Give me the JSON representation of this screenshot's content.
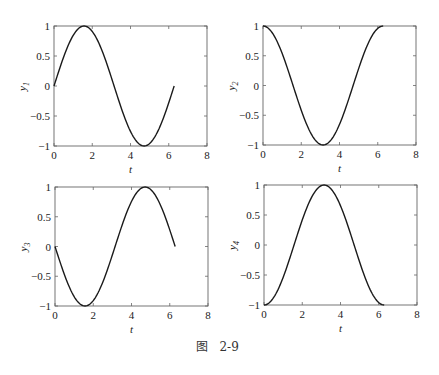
{
  "caption": "图   2-9",
  "chart_data": [
    {
      "type": "line",
      "title": "",
      "xlabel": "t",
      "ylabel": "y1",
      "xlim": [
        0,
        8
      ],
      "ylim": [
        -1,
        1
      ],
      "xticks": [
        0,
        2,
        4,
        6,
        8
      ],
      "yticks": [
        -1,
        -0.5,
        0,
        0.5,
        1
      ],
      "function": "sin(t)",
      "x": [
        0,
        0.5,
        1,
        1.5708,
        2,
        2.5,
        3,
        3.1416,
        3.5,
        4,
        4.5,
        4.7124,
        5,
        5.5,
        6,
        6.2832
      ],
      "values": [
        0,
        0.479,
        0.841,
        1,
        0.909,
        0.598,
        0.141,
        0,
        -0.351,
        -0.757,
        -0.978,
        -1,
        -0.959,
        -0.706,
        -0.279,
        0
      ]
    },
    {
      "type": "line",
      "title": "",
      "xlabel": "t",
      "ylabel": "y2",
      "xlim": [
        0,
        8
      ],
      "ylim": [
        -1,
        1
      ],
      "xticks": [
        0,
        2,
        4,
        6,
        8
      ],
      "yticks": [
        -1,
        -0.5,
        0,
        0.5,
        1
      ],
      "function": "cos(t)",
      "x": [
        0,
        0.5,
        1,
        1.5708,
        2,
        2.5,
        3,
        3.1416,
        3.5,
        4,
        4.5,
        4.7124,
        5,
        5.5,
        6,
        6.2832
      ],
      "values": [
        1,
        0.878,
        0.54,
        0,
        -0.416,
        -0.801,
        -0.99,
        -1,
        -0.936,
        -0.654,
        -0.211,
        0,
        0.284,
        0.709,
        0.96,
        1
      ]
    },
    {
      "type": "line",
      "title": "",
      "xlabel": "t",
      "ylabel": "y3",
      "xlim": [
        0,
        8
      ],
      "ylim": [
        -1,
        1
      ],
      "xticks": [
        0,
        2,
        4,
        6,
        8
      ],
      "yticks": [
        -1,
        -0.5,
        0,
        0.5,
        1
      ],
      "function": "-sin(t)",
      "x": [
        0,
        0.5,
        1,
        1.5708,
        2,
        2.5,
        3,
        3.1416,
        3.5,
        4,
        4.5,
        4.7124,
        5,
        5.5,
        6,
        6.2832
      ],
      "values": [
        0,
        -0.479,
        -0.841,
        -1,
        -0.909,
        -0.598,
        -0.141,
        0,
        0.351,
        0.757,
        0.978,
        1,
        0.959,
        0.706,
        0.279,
        0
      ]
    },
    {
      "type": "line",
      "title": "",
      "xlabel": "t",
      "ylabel": "y4",
      "xlim": [
        0,
        8
      ],
      "ylim": [
        -1,
        1
      ],
      "xticks": [
        0,
        2,
        4,
        6,
        8
      ],
      "yticks": [
        -1,
        -0.5,
        0,
        0.5,
        1
      ],
      "function": "-cos(t)",
      "x": [
        0,
        0.5,
        1,
        1.5708,
        2,
        2.5,
        3,
        3.1416,
        3.5,
        4,
        4.5,
        4.7124,
        5,
        5.5,
        6,
        6.2832
      ],
      "values": [
        -1,
        -0.878,
        -0.54,
        0,
        0.416,
        0.801,
        0.99,
        1,
        0.936,
        0.654,
        0.211,
        0,
        -0.284,
        -0.709,
        -0.96,
        -1
      ]
    }
  ],
  "panels": [
    {
      "ylabel_main": "y",
      "ylabel_sub": "1",
      "xlabel": "t",
      "box": [
        54,
        26,
        207,
        146
      ]
    },
    {
      "ylabel_main": "y",
      "ylabel_sub": "2",
      "xlabel": "t",
      "box": [
        263,
        26,
        416,
        145
      ]
    },
    {
      "ylabel_main": "y",
      "ylabel_sub": "3",
      "xlabel": "t",
      "box": [
        55,
        187,
        208,
        306
      ]
    },
    {
      "ylabel_main": "y",
      "ylabel_sub": "4",
      "xlabel": "t",
      "box": [
        264,
        185,
        417,
        305
      ]
    }
  ],
  "tick_labels": {
    "x": [
      "0",
      "2",
      "4",
      "6",
      "8"
    ],
    "y": [
      "1",
      "0.5",
      "0",
      "−0.5",
      "−1"
    ]
  }
}
